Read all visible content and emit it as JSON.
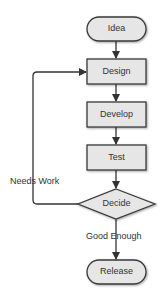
{
  "diagram": {
    "type": "flowchart",
    "nodes": [
      {
        "id": "idea",
        "label": "Idea",
        "shape": "terminal"
      },
      {
        "id": "design",
        "label": "Design",
        "shape": "process"
      },
      {
        "id": "develop",
        "label": "Develop",
        "shape": "process"
      },
      {
        "id": "test",
        "label": "Test",
        "shape": "process"
      },
      {
        "id": "decide",
        "label": "Decide",
        "shape": "decision"
      },
      {
        "id": "release",
        "label": "Release",
        "shape": "terminal"
      }
    ],
    "edges": [
      {
        "from": "idea",
        "to": "design",
        "label": ""
      },
      {
        "from": "design",
        "to": "develop",
        "label": ""
      },
      {
        "from": "develop",
        "to": "test",
        "label": ""
      },
      {
        "from": "test",
        "to": "decide",
        "label": ""
      },
      {
        "from": "decide",
        "to": "design",
        "label": "Needs Work"
      },
      {
        "from": "decide",
        "to": "release",
        "label": "Good Enough"
      }
    ],
    "colors": {
      "fill": "#e6e6e6",
      "stroke": "#3a3a3a",
      "text": "#333333"
    }
  }
}
